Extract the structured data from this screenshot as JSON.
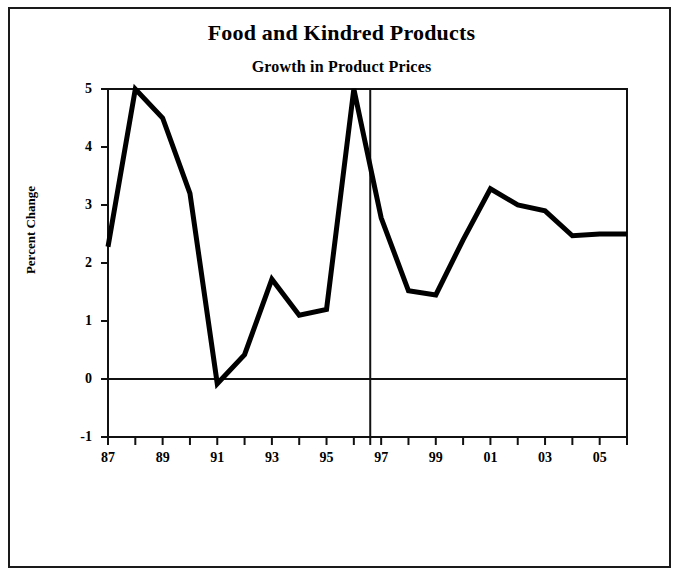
{
  "chart_data": {
    "type": "line",
    "title": "Food and Kindred Products",
    "subtitle": "Growth in Product Prices",
    "xlabel": "",
    "ylabel": "Percent Change",
    "ylim": [
      -1,
      5
    ],
    "yticks": [
      -1,
      0,
      1,
      2,
      3,
      4,
      5
    ],
    "ytick_labels": [
      "-1",
      "0",
      "1",
      "2",
      "3",
      "4",
      "5"
    ],
    "xlim": [
      1987,
      2006
    ],
    "xticks": [
      1987,
      1988,
      1989,
      1990,
      1991,
      1992,
      1993,
      1994,
      1995,
      1996,
      1997,
      1998,
      1999,
      2000,
      2001,
      2002,
      2003,
      2004,
      2005,
      2006
    ],
    "xtick_labels": [
      "87",
      "",
      "89",
      "",
      "91",
      "",
      "93",
      "",
      "95",
      "",
      "97",
      "",
      "99",
      "",
      "01",
      "",
      "03",
      "",
      "05",
      ""
    ],
    "grid": false,
    "legend": null,
    "zero_line": 0,
    "divider_x": 1996.6,
    "line_color": "#000000",
    "line_width": 5,
    "x": [
      1987,
      1988,
      1989,
      1990,
      1991,
      1992,
      1993,
      1994,
      1995,
      1996,
      1997,
      1998,
      1999,
      2000,
      2001,
      2002,
      2003,
      2004,
      2005,
      2006
    ],
    "values": [
      2.28,
      5.0,
      4.5,
      3.2,
      -0.08,
      0.42,
      1.72,
      1.1,
      1.2,
      5.0,
      2.78,
      1.52,
      1.45,
      2.4,
      3.28,
      3.0,
      2.9,
      2.47,
      2.5,
      2.5
    ],
    "series": [
      {
        "name": "Growth in Product Prices",
        "values": [
          2.28,
          5.0,
          4.5,
          3.2,
          -0.08,
          0.42,
          1.72,
          1.1,
          1.2,
          5.0,
          2.78,
          1.52,
          1.45,
          2.4,
          3.28,
          3.0,
          2.9,
          2.47,
          2.5,
          2.5
        ]
      }
    ]
  },
  "geometry": {
    "plot_left": 108,
    "plot_right": 627,
    "plot_top": 89,
    "plot_bottom": 437,
    "x_step": 27.3,
    "y_unit": 58
  }
}
